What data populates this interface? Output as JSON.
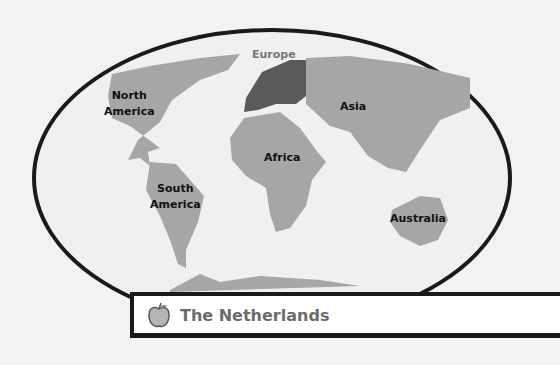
{
  "map": {
    "continents": [
      {
        "name": "North America",
        "lines": [
          "North",
          "America"
        ]
      },
      {
        "name": "South America",
        "lines": [
          "South",
          "America"
        ]
      },
      {
        "name": "Europe",
        "lines": [
          "Europe"
        ],
        "highlighted": true
      },
      {
        "name": "Africa",
        "lines": [
          "Africa"
        ]
      },
      {
        "name": "Asia",
        "lines": [
          "Asia"
        ]
      },
      {
        "name": "Australia",
        "lines": [
          "Australia"
        ]
      }
    ],
    "colors": {
      "land": "#a6a6a6",
      "highlight": "#5a5a5a",
      "ocean": "#f0f0f0",
      "outline": "#1a1a1a"
    }
  },
  "banner": {
    "icon": "apple-icon",
    "title": "The Netherlands"
  }
}
